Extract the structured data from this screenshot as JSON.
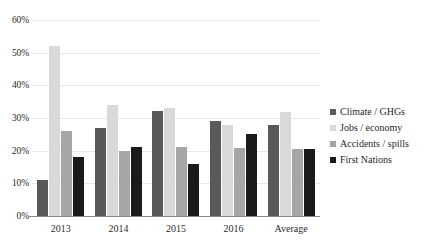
{
  "chart_data": {
    "type": "bar",
    "title": "",
    "subtitle": "",
    "xlabel": "",
    "ylabel": "",
    "categories": [
      "2013",
      "2014",
      "2015",
      "2016",
      "Average"
    ],
    "series": [
      {
        "name": "Climate / GHGs",
        "color": "#595959",
        "values": [
          11,
          27,
          32,
          29,
          27.8
        ]
      },
      {
        "name": "Jobs / economy",
        "color": "#d9d9d9",
        "values": [
          52,
          34,
          33,
          28,
          31.8
        ]
      },
      {
        "name": "Accidents / spills",
        "color": "#a6a6a6",
        "values": [
          26,
          20,
          21,
          20.8,
          20.5
        ]
      },
      {
        "name": "First Nations",
        "color": "#1a1a1a",
        "values": [
          18,
          21,
          16,
          25,
          20.5
        ]
      }
    ],
    "ylim": [
      0,
      60
    ],
    "y_ticks": [
      0,
      10,
      20,
      30,
      40,
      50,
      60
    ],
    "y_tick_labels": [
      "0%",
      "10%",
      "20%",
      "30%",
      "40%",
      "50%",
      "60%"
    ],
    "grid": true,
    "grid_axis": "y",
    "legend_position": "right",
    "value_suffix": "%"
  },
  "axes": {
    "y_tick_labels": [
      "0%",
      "10%",
      "20%",
      "30%",
      "40%",
      "50%",
      "60%"
    ],
    "x_tick_labels": [
      "2013",
      "2014",
      "2015",
      "2016",
      "Average"
    ]
  },
  "legend": {
    "items": [
      {
        "label": "Climate / GHGs",
        "color": "#595959"
      },
      {
        "label": "Jobs / economy",
        "color": "#d9d9d9"
      },
      {
        "label": "Accidents / spills",
        "color": "#a6a6a6"
      },
      {
        "label": "First Nations",
        "color": "#1a1a1a"
      }
    ]
  },
  "colors": {
    "background": "#ffffff",
    "gridline": "#e8e8e8",
    "axis": "#8a8a8a",
    "text": "#2b2b2b"
  }
}
